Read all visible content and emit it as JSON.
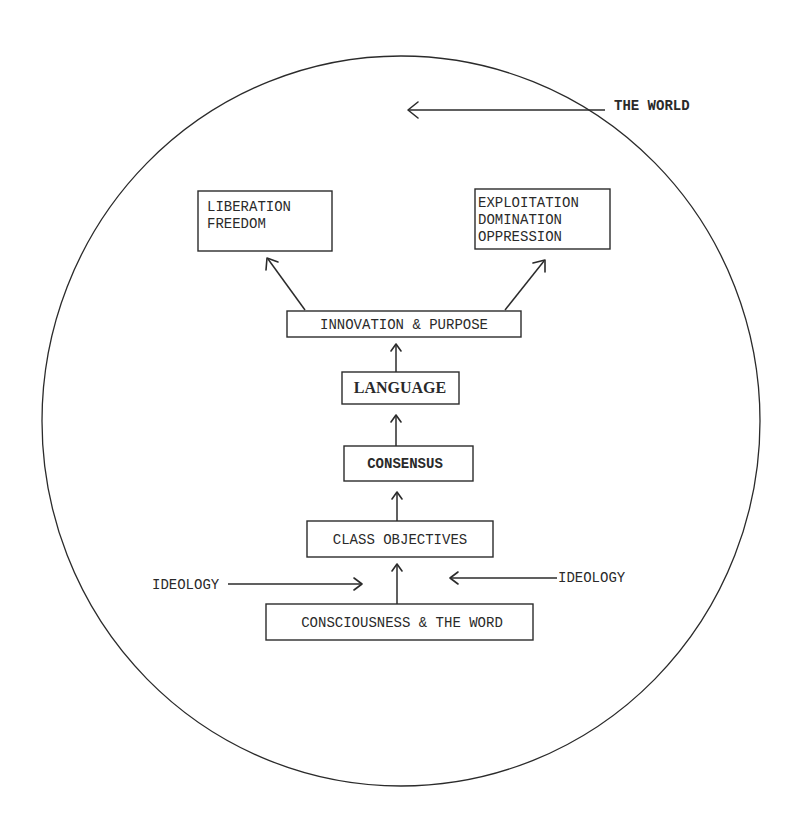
{
  "diagram": {
    "world": {
      "label": "THE WORLD",
      "shape": "circle"
    },
    "outcomes": {
      "left": {
        "lines": [
          "LIBERATION",
          "FREEDOM"
        ]
      },
      "right": {
        "lines": [
          "EXPLOITATION",
          "DOMINATION",
          "OPPRESSION"
        ]
      }
    },
    "stages": [
      {
        "label": "INNOVATION & PURPOSE"
      },
      {
        "label": "LANGUAGE"
      },
      {
        "label": "CONSENSUS"
      },
      {
        "label": "CLASS OBJECTIVES"
      },
      {
        "label": "CONSCIOUSNESS & THE WORD"
      }
    ],
    "influences": {
      "left": {
        "label": "IDEOLOGY"
      },
      "right": {
        "label": "IDEOLOGY"
      }
    },
    "colors": {
      "ink": "#2b2b2b",
      "paper": "#ffffff"
    }
  }
}
